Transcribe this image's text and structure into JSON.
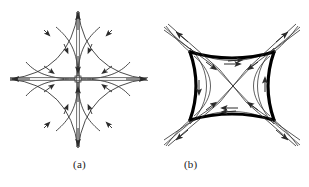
{
  "figure": {
    "background_color": "#ffffff",
    "stroke_color": "#2b2b2b",
    "thick_stroke_color": "#000000",
    "width": 309,
    "height": 187,
    "panels": [
      {
        "id": "a",
        "caption": "(a)",
        "description": "four-pointed concave star with straight double-line axes and inner separatrix petals",
        "center": {
          "x": 78,
          "y": 79
        },
        "axes": {
          "horizontal": {
            "x1": 8,
            "x2": 150,
            "y": 79,
            "arrows": [
              "left",
              "right"
            ],
            "double_line": true
          },
          "vertical": {
            "y1": 10,
            "y2": 150,
            "x": 78,
            "arrows": [
              "up",
              "down"
            ],
            "double_line": true
          }
        },
        "star_tips": [
          {
            "label": "top",
            "x": 78,
            "y": 11
          },
          {
            "label": "right",
            "x": 147,
            "y": 79
          },
          {
            "label": "bottom",
            "x": 78,
            "y": 148
          },
          {
            "label": "left",
            "x": 10,
            "y": 79
          }
        ],
        "petal_count": 4,
        "arrow_direction_on_axes": "outward",
        "arrow_direction_on_petals": "inward-to-center"
      },
      {
        "id": "b",
        "caption": "(b)",
        "description": "thick concave square (pillow) separatrix with thin diagonal saddle connections and outward diagonal tails",
        "center": {
          "x": 78,
          "y": 86
        },
        "thick_shape": {
          "type": "concave-square",
          "corners": [
            {
              "label": "top-left",
              "x": 36,
              "y": 52
            },
            {
              "label": "top-right",
              "x": 120,
              "y": 52
            },
            {
              "label": "bottom-right",
              "x": 120,
              "y": 120
            },
            {
              "label": "bottom-left",
              "x": 36,
              "y": 120
            }
          ],
          "waist_x": 78,
          "waist_y": 86
        },
        "diagonal_tails": [
          {
            "label": "upper-left",
            "x": 8,
            "y": 22
          },
          {
            "label": "upper-right",
            "x": 148,
            "y": 22
          },
          {
            "label": "lower-right",
            "x": 148,
            "y": 150
          },
          {
            "label": "lower-left",
            "x": 8,
            "y": 150
          }
        ],
        "arrow_direction_on_tails": "outward",
        "arrow_direction_on_edges": "toward-corners"
      }
    ]
  }
}
